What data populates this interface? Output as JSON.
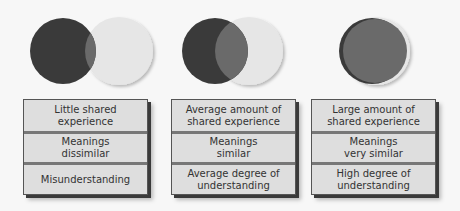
{
  "colors": {
    "dark_circle": "#3a3a3a",
    "light_circle": "#e6e6e6",
    "overlap": "#6a6a6a",
    "panel_bg": "#dedede",
    "text": "#333333"
  },
  "columns": [
    {
      "overlap_level": "little",
      "cells": [
        "Little shared\nexperience",
        "Meanings\ndissimilar",
        "Misunderstanding"
      ]
    },
    {
      "overlap_level": "average",
      "cells": [
        "Average amount of\nshared experience",
        "Meanings\nsimilar",
        "Average degree of\nunderstanding"
      ]
    },
    {
      "overlap_level": "large",
      "cells": [
        "Large amount of\nshared experience",
        "Meanings\nvery similar",
        "High degree of\nunderstanding"
      ]
    }
  ]
}
